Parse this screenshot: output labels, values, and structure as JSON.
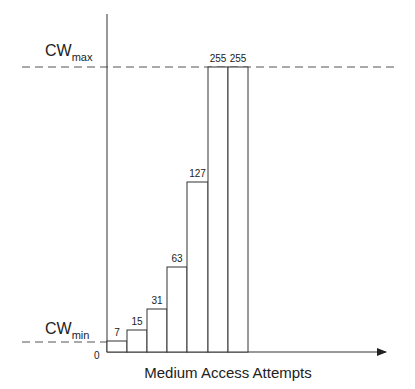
{
  "chart_data": {
    "type": "bar",
    "title": "",
    "xlabel": "Medium Access Attempts",
    "ylabel": "",
    "origin_label": "0",
    "categories": [
      "1",
      "2",
      "3",
      "4",
      "5",
      "6",
      "7"
    ],
    "values": [
      7,
      15,
      31,
      63,
      127,
      255,
      255
    ],
    "value_labels": [
      "7",
      "15",
      "31",
      "63",
      "127",
      "255",
      "255"
    ],
    "ylim": [
      0,
      255
    ],
    "grid": false,
    "legend": null,
    "annotations": [
      {
        "text": "CW",
        "subscript": "max",
        "value": 255,
        "style": "dashed-horizontal-line"
      },
      {
        "text": "CW",
        "subscript": "min",
        "value": 7,
        "style": "dashed-horizontal-line"
      }
    ],
    "bar_style": {
      "fill": "#ffffff",
      "stroke": "#333333"
    }
  }
}
